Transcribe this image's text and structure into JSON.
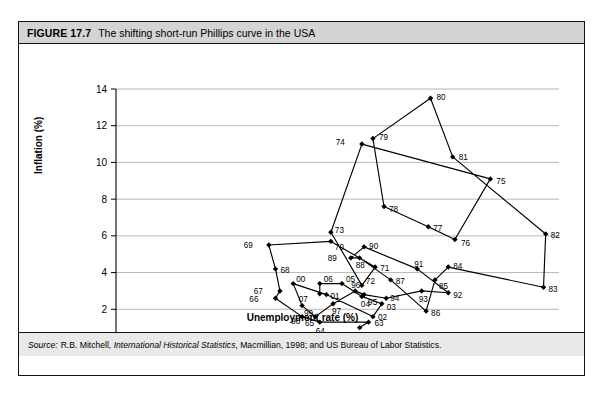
{
  "figure": {
    "number": "FIGURE 17.7",
    "title": "The shifting short-run Phillips curve in the USA",
    "source_label": "Source:",
    "source_text_1": "R.B. Mitchell, ",
    "source_italic": "International Historical Statistics",
    "source_text_2": ", Macmillian, 1998; and US Bureau of Labor Statistics."
  },
  "chart_data": {
    "type": "scatter",
    "title": "The shifting short-run Phillips curve in the USA",
    "xlabel": "Unemployment rate (%)",
    "ylabel": "Inflation (%)",
    "xlim": [
      0,
      10
    ],
    "ylim": [
      0,
      14
    ],
    "xticks": [
      0,
      1,
      2,
      3,
      4,
      5,
      6,
      7,
      8,
      9,
      10
    ],
    "yticks": [
      0,
      2,
      4,
      6,
      8,
      10,
      12,
      14
    ],
    "grid": "horizontal",
    "legend": "none",
    "connected": true,
    "marker": "filled-diamond",
    "series_name": "USA year-by-year unemployment vs inflation",
    "points": [
      {
        "label": "62",
        "x": 5.5,
        "y": 1.0,
        "lx": 6,
        "ly": 12
      },
      {
        "label": "63",
        "x": 5.7,
        "y": 1.3,
        "lx": 6,
        "ly": 4
      },
      {
        "label": "64",
        "x": 4.6,
        "y": 1.3,
        "lx": -4,
        "ly": 12
      },
      {
        "label": "65",
        "x": 4.2,
        "y": 1.6,
        "lx": 3,
        "ly": 9
      },
      {
        "label": "66",
        "x": 3.6,
        "y": 2.6,
        "lx": -17,
        "ly": 4
      },
      {
        "label": "67",
        "x": 3.7,
        "y": 3.0,
        "lx": -17,
        "ly": 3
      },
      {
        "label": "68",
        "x": 3.6,
        "y": 4.2,
        "lx": 5,
        "ly": 4
      },
      {
        "label": "69",
        "x": 3.45,
        "y": 5.5,
        "lx": -16,
        "ly": 3
      },
      {
        "label": "70",
        "x": 4.85,
        "y": 5.7,
        "lx": 4,
        "ly": 9
      },
      {
        "label": "71",
        "x": 5.85,
        "y": 4.3,
        "lx": 5,
        "ly": 4
      },
      {
        "label": "72",
        "x": 5.55,
        "y": 3.3,
        "lx": 4,
        "ly": -1
      },
      {
        "label": "73",
        "x": 4.85,
        "y": 6.2,
        "lx": 4,
        "ly": 1
      },
      {
        "label": "74",
        "x": 5.55,
        "y": 11.0,
        "lx": -17,
        "ly": 1
      },
      {
        "label": "75",
        "x": 8.45,
        "y": 9.1,
        "lx": 6,
        "ly": 5
      },
      {
        "label": "76",
        "x": 7.65,
        "y": 5.8,
        "lx": 6,
        "ly": 6
      },
      {
        "label": "77",
        "x": 7.05,
        "y": 6.5,
        "lx": 5,
        "ly": 4
      },
      {
        "label": "78",
        "x": 6.05,
        "y": 7.6,
        "lx": 5,
        "ly": 6
      },
      {
        "label": "79",
        "x": 5.8,
        "y": 11.3,
        "lx": 6,
        "ly": 1
      },
      {
        "label": "80",
        "x": 7.1,
        "y": 13.5,
        "lx": 6,
        "ly": 2
      },
      {
        "label": "81",
        "x": 7.6,
        "y": 10.3,
        "lx": 6,
        "ly": 3
      },
      {
        "label": "82",
        "x": 9.7,
        "y": 6.1,
        "lx": 5,
        "ly": 4
      },
      {
        "label": "83",
        "x": 9.65,
        "y": 3.2,
        "lx": 5,
        "ly": 5
      },
      {
        "label": "84",
        "x": 7.5,
        "y": 4.3,
        "lx": 5,
        "ly": 2
      },
      {
        "label": "85",
        "x": 7.2,
        "y": 3.6,
        "lx": 4,
        "ly": 9
      },
      {
        "label": "86",
        "x": 7.0,
        "y": 1.9,
        "lx": 5,
        "ly": 5
      },
      {
        "label": "87",
        "x": 6.2,
        "y": 3.6,
        "lx": 5,
        "ly": 4
      },
      {
        "label": "88",
        "x": 5.5,
        "y": 4.8,
        "lx": -4,
        "ly": 10
      },
      {
        "label": "89",
        "x": 5.3,
        "y": 4.8,
        "lx": -14,
        "ly": 3
      },
      {
        "label": "90",
        "x": 5.6,
        "y": 5.4,
        "lx": 5,
        "ly": 2
      },
      {
        "label": "91",
        "x": 6.8,
        "y": 4.2,
        "lx": -3,
        "ly": -2
      },
      {
        "label": "92",
        "x": 7.5,
        "y": 2.9,
        "lx": 5,
        "ly": 5
      },
      {
        "label": "93",
        "x": 6.9,
        "y": 3.0,
        "lx": -3,
        "ly": 11
      },
      {
        "label": "94",
        "x": 6.1,
        "y": 2.6,
        "lx": 4,
        "ly": 3
      },
      {
        "label": "95",
        "x": 5.6,
        "y": 2.8,
        "lx": 4,
        "ly": 10
      },
      {
        "label": "96",
        "x": 5.4,
        "y": 3.0,
        "lx": -4,
        "ly": -3
      },
      {
        "label": "97",
        "x": 4.9,
        "y": 2.3,
        "lx": -1,
        "ly": 10
      },
      {
        "label": "98",
        "x": 4.5,
        "y": 1.6,
        "lx": -15,
        "ly": 7
      },
      {
        "label": "99",
        "x": 4.2,
        "y": 2.2,
        "lx": 2,
        "ly": 10
      },
      {
        "label": "00",
        "x": 4.0,
        "y": 3.4,
        "lx": 3,
        "ly": -2
      },
      {
        "label": "01",
        "x": 4.75,
        "y": 2.8,
        "lx": 4,
        "ly": 4
      },
      {
        "label": "02",
        "x": 5.8,
        "y": 1.6,
        "lx": 5,
        "ly": 3
      },
      {
        "label": "03",
        "x": 6.0,
        "y": 2.3,
        "lx": 5,
        "ly": 6
      },
      {
        "label": "04",
        "x": 5.55,
        "y": 2.7,
        "lx": -1,
        "ly": 11
      },
      {
        "label": "05",
        "x": 5.1,
        "y": 3.4,
        "lx": 4,
        "ly": -2
      },
      {
        "label": "06",
        "x": 4.6,
        "y": 3.4,
        "lx": 4,
        "ly": -2
      },
      {
        "label": "07",
        "x": 4.6,
        "y": 2.85,
        "lx": -12,
        "ly": 8
      }
    ],
    "path_order": [
      "62",
      "63",
      "64",
      "65",
      "66",
      "67",
      "68",
      "69",
      "70",
      "71",
      "72",
      "73",
      "74",
      "75",
      "76",
      "77",
      "78",
      "79",
      "80",
      "81",
      "82",
      "83",
      "84",
      "85",
      "86",
      "87",
      "88",
      "89",
      "90",
      "91",
      "92",
      "93",
      "94",
      "95",
      "96",
      "97",
      "98",
      "99",
      "00",
      "01",
      "02",
      "03",
      "04",
      "05",
      "06",
      "07"
    ]
  }
}
